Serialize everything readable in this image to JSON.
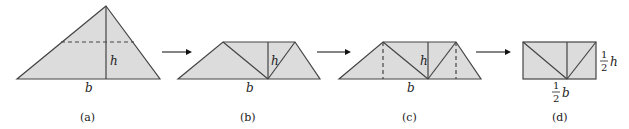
{
  "colors": {
    "fill": "#dcdcdc",
    "stroke": "#444444",
    "text": "#222222"
  },
  "panels": [
    {
      "id": "a",
      "caption": "(a)",
      "base_label": "b",
      "height_label": "h"
    },
    {
      "id": "b",
      "caption": "(b)",
      "base_label": "b",
      "height_label": "h"
    },
    {
      "id": "c",
      "caption": "(c)",
      "base_label": "b",
      "height_label": "h"
    },
    {
      "id": "d",
      "caption": "(d)",
      "base_label_num": "1",
      "base_label_den": "2",
      "base_label_var": "b",
      "height_label_num": "1",
      "height_label_den": "2",
      "height_label_var": "h"
    }
  ],
  "arrows": 3
}
